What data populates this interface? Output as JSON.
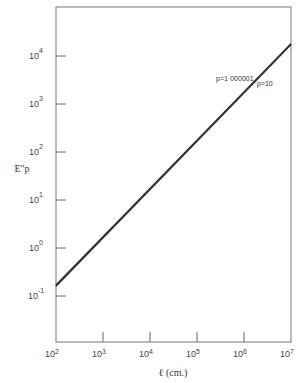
{
  "chart_data": {
    "type": "line",
    "title": "",
    "xlabel": "ℓ (cm.)",
    "ylabel": "E\"p",
    "xscale": "log",
    "yscale": "log",
    "xlim": [
      100,
      10000000
    ],
    "ylim": [
      0.05,
      50000
    ],
    "x_ticks": [
      {
        "base": "10",
        "exp": "2",
        "value": 100
      },
      {
        "base": "10",
        "exp": "3",
        "value": 1000
      },
      {
        "base": "10",
        "exp": "4",
        "value": 10000
      },
      {
        "base": "10",
        "exp": "5",
        "value": 100000
      },
      {
        "base": "10",
        "exp": "6",
        "value": 1000000
      },
      {
        "base": "10",
        "exp": "7",
        "value": 10000000
      }
    ],
    "y_ticks": [
      {
        "base": "10",
        "exp": "4",
        "value": 10000
      },
      {
        "base": "10",
        "exp": "3",
        "value": 1000
      },
      {
        "base": "10",
        "exp": "2",
        "value": 100
      },
      {
        "base": "10",
        "exp": "1",
        "value": 10
      },
      {
        "base": "10",
        "exp": "0",
        "value": 1
      },
      {
        "base": "10",
        "exp": "-1",
        "value": 0.1
      }
    ],
    "grid": false,
    "legend": "none (inline labels near top-right)",
    "series": [
      {
        "name": "p=1·000001",
        "label": "p=1·000001",
        "x": [
          100,
          10000000
        ],
        "y": [
          0.17,
          18000
        ]
      },
      {
        "name": "p=10",
        "label": "p=10",
        "x": [
          100,
          10000000
        ],
        "y": [
          0.16,
          17500
        ]
      }
    ]
  }
}
